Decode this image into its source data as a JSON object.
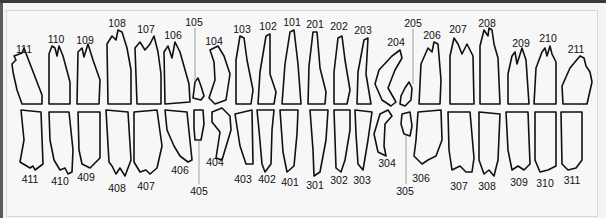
{
  "upper_row": [
    {
      "id": "111",
      "x": 24,
      "ly": 44
    },
    {
      "id": "110",
      "x": 56,
      "ly": 34
    },
    {
      "id": "109",
      "x": 85,
      "ly": 35
    },
    {
      "id": "108",
      "x": 117,
      "ly": 18
    },
    {
      "id": "107",
      "x": 146,
      "ly": 24
    },
    {
      "id": "106",
      "x": 173,
      "ly": 30
    },
    {
      "id": "105",
      "x": 194,
      "ly": 17
    },
    {
      "id": "104",
      "x": 214,
      "ly": 36
    },
    {
      "id": "103",
      "x": 242,
      "ly": 24
    },
    {
      "id": "102",
      "x": 268,
      "ly": 21
    },
    {
      "id": "101",
      "x": 292,
      "ly": 17
    },
    {
      "id": "201",
      "x": 315,
      "ly": 19
    },
    {
      "id": "202",
      "x": 339,
      "ly": 21
    },
    {
      "id": "203",
      "x": 363,
      "ly": 25
    },
    {
      "id": "204",
      "x": 396,
      "ly": 37
    },
    {
      "id": "205",
      "x": 413,
      "ly": 18
    },
    {
      "id": "206",
      "x": 432,
      "ly": 30
    },
    {
      "id": "207",
      "x": 458,
      "ly": 24
    },
    {
      "id": "208",
      "x": 487,
      "ly": 18
    },
    {
      "id": "209",
      "x": 521,
      "ly": 38
    },
    {
      "id": "210",
      "x": 548,
      "ly": 33
    },
    {
      "id": "211",
      "x": 576,
      "ly": 44
    }
  ],
  "lower_row": [
    {
      "id": "411",
      "x": 30,
      "ly": 174
    },
    {
      "id": "410",
      "x": 60,
      "ly": 176
    },
    {
      "id": "409",
      "x": 86,
      "ly": 172
    },
    {
      "id": "408",
      "x": 117,
      "ly": 183
    },
    {
      "id": "407",
      "x": 146,
      "ly": 181
    },
    {
      "id": "406",
      "x": 180,
      "ly": 165
    },
    {
      "id": "405",
      "x": 199,
      "ly": 186
    },
    {
      "id": "404",
      "x": 215,
      "ly": 157
    },
    {
      "id": "403",
      "x": 243,
      "ly": 174
    },
    {
      "id": "402",
      "x": 267,
      "ly": 174
    },
    {
      "id": "401",
      "x": 290,
      "ly": 177
    },
    {
      "id": "301",
      "x": 315,
      "ly": 180
    },
    {
      "id": "302",
      "x": 339,
      "ly": 175
    },
    {
      "id": "303",
      "x": 362,
      "ly": 175
    },
    {
      "id": "304",
      "x": 387,
      "ly": 158
    },
    {
      "id": "305",
      "x": 405,
      "ly": 186
    },
    {
      "id": "306",
      "x": 421,
      "ly": 173
    },
    {
      "id": "307",
      "x": 459,
      "ly": 181
    },
    {
      "id": "308",
      "x": 487,
      "ly": 181
    },
    {
      "id": "309",
      "x": 519,
      "ly": 177
    },
    {
      "id": "310",
      "x": 545,
      "ly": 178
    },
    {
      "id": "311",
      "x": 572,
      "ly": 175
    }
  ]
}
